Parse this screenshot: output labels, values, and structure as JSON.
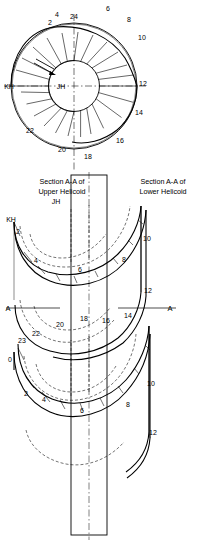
{
  "figure": {
    "captions": [
      {
        "id": "caption-upper",
        "line1": "Section A-A of",
        "line2": "Upper Helicoid",
        "x": 62,
        "y": 186
      },
      {
        "id": "caption-lower",
        "line1": "Section A-A of",
        "line2": "Lower Helicoid",
        "x": 160,
        "y": 186
      }
    ],
    "plan": {
      "center": {
        "x": 74,
        "y": 86
      },
      "radius_outer": 63,
      "radius_hub": 25,
      "divisions": 24,
      "labels": [
        {
          "text": "24",
          "x": 74,
          "y": 19
        },
        {
          "text": "2",
          "x": 50,
          "y": 25
        },
        {
          "text": "4",
          "x": 57,
          "y": 17
        },
        {
          "text": "6",
          "x": 108,
          "y": 11
        },
        {
          "text": "8",
          "x": 129,
          "y": 22
        },
        {
          "text": "10",
          "x": 142,
          "y": 40
        },
        {
          "text": "12",
          "x": 143,
          "y": 86
        },
        {
          "text": "14",
          "x": 139,
          "y": 115
        },
        {
          "text": "16",
          "x": 120,
          "y": 143
        },
        {
          "text": "18",
          "x": 88,
          "y": 159
        },
        {
          "text": "20",
          "x": 62,
          "y": 152
        },
        {
          "text": "22",
          "x": 30,
          "y": 133
        },
        {
          "text": "KH",
          "x": 8,
          "y": 86
        },
        {
          "text": "JH",
          "x": 61,
          "y": 88
        }
      ]
    },
    "elevation": {
      "labels": [
        {
          "text": "JH",
          "x": 55,
          "y": 203
        },
        {
          "text": "KH",
          "x": 10,
          "y": 222
        },
        {
          "text": "2",
          "x": 18,
          "y": 232
        },
        {
          "text": "4",
          "x": 36,
          "y": 262
        },
        {
          "text": "6",
          "x": 80,
          "y": 272
        },
        {
          "text": "8",
          "x": 124,
          "y": 262
        },
        {
          "text": "10",
          "x": 143,
          "y": 240
        },
        {
          "text": "12",
          "x": 144,
          "y": 292
        },
        {
          "text": "14",
          "x": 126,
          "y": 318
        },
        {
          "text": "16",
          "x": 104,
          "y": 323
        },
        {
          "text": "18",
          "x": 84,
          "y": 321
        },
        {
          "text": "20",
          "x": 60,
          "y": 327
        },
        {
          "text": "22",
          "x": 34,
          "y": 336
        },
        {
          "text": "23",
          "x": 22,
          "y": 341
        },
        {
          "text": "0",
          "x": 10,
          "y": 361
        },
        {
          "text": "2",
          "x": 24,
          "y": 395
        },
        {
          "text": "4",
          "x": 42,
          "y": 400
        },
        {
          "text": "6",
          "x": 82,
          "y": 412
        },
        {
          "text": "8",
          "x": 128,
          "y": 406
        },
        {
          "text": "10",
          "x": 148,
          "y": 385
        },
        {
          "text": "12",
          "x": 150,
          "y": 434
        }
      ],
      "section_marks": [
        {
          "text": "A",
          "x": 8,
          "y": 309
        },
        {
          "text": "A",
          "x": 168,
          "y": 309
        }
      ]
    },
    "colors": {
      "line": "#000000",
      "background": "#ffffff"
    }
  }
}
